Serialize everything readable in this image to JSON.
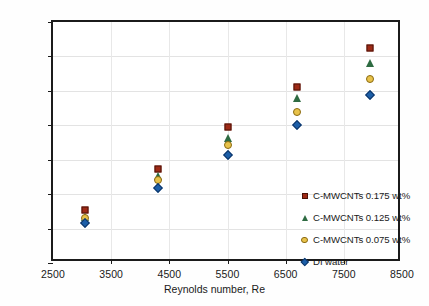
{
  "chart_data": {
    "type": "scatter",
    "title": "",
    "xlabel": "Reynolds number, Re",
    "ylabel": "Average Nusselt number, Nu",
    "xlim": [
      2500,
      8500
    ],
    "ylim": [
      20,
      90
    ],
    "xticks": [
      2500,
      3500,
      4500,
      5500,
      6500,
      7500,
      8500
    ],
    "yticks": [
      20,
      30,
      40,
      50,
      60,
      70,
      80,
      90
    ],
    "xtick_labels": [
      "2500",
      "3500",
      "4500",
      "5500",
      "6500",
      "7500",
      "8500"
    ],
    "ytick_labels": [
      "20",
      "30",
      "40",
      "50",
      "60",
      "70",
      "80",
      "90"
    ],
    "grid": "both-light",
    "legend_position": "inside-lower-right",
    "x": [
      3050,
      4300,
      5500,
      6700,
      7950
    ],
    "series": [
      {
        "name": "C-MWCNTs 0.175 wt%",
        "marker": "square",
        "color": "#9e2a16",
        "values": [
          35.3,
          47.3,
          59.5,
          71.0,
          82.4
        ]
      },
      {
        "name": "C-MWCNTs 0.125 wt%",
        "marker": "triangle",
        "color": "#2e6b42",
        "values": [
          33.5,
          45.3,
          56.3,
          67.8,
          78.1
        ]
      },
      {
        "name": "C-MWCNTs 0.075 wt%",
        "marker": "circle",
        "color": "#e8c24a",
        "values": [
          33.0,
          44.0,
          54.4,
          64.0,
          73.5
        ]
      },
      {
        "name": "DI water",
        "marker": "diamond",
        "color": "#1c5fa8",
        "values": [
          31.7,
          41.7,
          51.4,
          60.2,
          68.8
        ]
      }
    ]
  },
  "legend": {
    "items": [
      {
        "label": "C-MWCNTs 0.175 wt%",
        "marker": "square"
      },
      {
        "label": "C-MWCNTs 0.125 wt%",
        "marker": "triangle"
      },
      {
        "label": "C-MWCNTs 0.075 wt%",
        "marker": "circle"
      },
      {
        "label": "DI water",
        "marker": "diamond"
      }
    ]
  }
}
